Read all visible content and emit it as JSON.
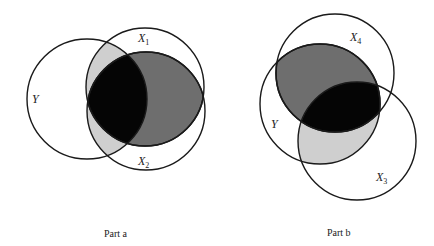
{
  "diagram": {
    "type": "venn",
    "panels": [
      {
        "id": "part-a",
        "caption": "Part a",
        "circles": [
          {
            "label": "Y",
            "label_sub": "",
            "cx": 87,
            "cy": 99,
            "r": 60
          },
          {
            "label": "X",
            "label_sub": "1",
            "cx": 145,
            "cy": 87,
            "r": 59
          },
          {
            "label": "X",
            "label_sub": "2",
            "cx": 146,
            "cy": 111,
            "r": 59
          }
        ],
        "shading": {
          "black": "Y ∩ X1 ∩ X2",
          "dark_gray": "X1 ∩ X2 outside Y",
          "light_gray": "Y ∩ (X1 ∪ X2) outside X1 ∩ X2"
        }
      },
      {
        "id": "part-b",
        "caption": "Part b",
        "circles": [
          {
            "label": "Y",
            "label_sub": "",
            "cx": 320,
            "cy": 104,
            "r": 60
          },
          {
            "label": "X",
            "label_sub": "4",
            "cx": 335,
            "cy": 73,
            "r": 59
          },
          {
            "label": "X",
            "label_sub": "3",
            "cx": 357,
            "cy": 141,
            "r": 59
          }
        ],
        "shading": {
          "black": "Y ∩ X4 ∩ X3",
          "dark_gray": "Y ∩ X4 outside X3",
          "light_gray": "Y ∩ X3 outside X4"
        }
      }
    ],
    "colors": {
      "black": "#050505",
      "dark_gray": "#6e6e6e",
      "light_gray": "#cfcfcf",
      "stroke": "#1a1a1a"
    }
  }
}
